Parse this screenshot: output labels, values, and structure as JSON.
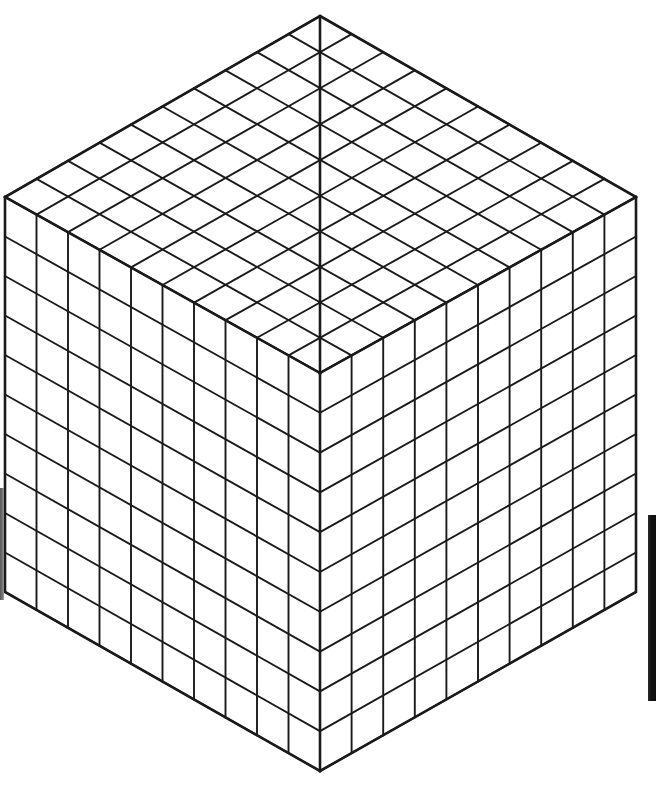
{
  "figure": {
    "type": "isometric-cube-grid",
    "background_color": "#ffffff",
    "line_color": "#1a1a1a",
    "face_fill_color": "#ffffff",
    "outline_stroke_width": 2.6,
    "grid_stroke_width": 1.9,
    "divisions_per_edge": 10,
    "total_unit_cubes": 1000,
    "visible_faces": [
      "top",
      "left",
      "right"
    ],
    "unit_squares_per_visible_face": 100,
    "total_visible_unit_squares": 300,
    "canvas": {
      "width": 658,
      "height": 788
    }
  },
  "geometry": {
    "apex_top": {
      "x": 320,
      "y": 16
    },
    "vertex_left": {
      "x": 5,
      "y": 197
    },
    "vertex_right": {
      "x": 636,
      "y": 197
    },
    "vertex_front_top": {
      "x": 320,
      "y": 373
    },
    "vertex_bottom_left": {
      "x": 5,
      "y": 592
    },
    "vertex_bottom_right": {
      "x": 636,
      "y": 592
    },
    "vertex_bottom": {
      "x": 320,
      "y": 771
    },
    "step_x": 31.5,
    "step_y_iso": 18.1,
    "step_y_vertical": 39.8
  },
  "artifacts": [
    {
      "name": "right-edge-scan-bar",
      "color": "#121212",
      "x": 648,
      "y": 515,
      "width": 8,
      "height": 186
    },
    {
      "name": "left-edge-scan-smudge",
      "color": "#555555",
      "x": 0,
      "y": 488,
      "width": 4,
      "height": 112
    }
  ]
}
